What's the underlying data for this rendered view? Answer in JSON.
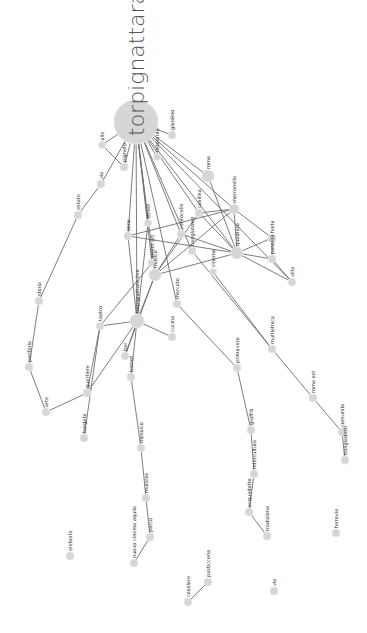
{
  "graph": {
    "title": "torpignattara",
    "node_color": "#d6d6d6",
    "edge_color": "#6e6e6e",
    "nodes": [
      {
        "id": "torpignattara",
        "label": "torpignattara",
        "x": 136,
        "y": 122,
        "r": 22,
        "main": true
      },
      {
        "id": "n1",
        "label": "giardino",
        "x": 172,
        "y": 135,
        "r": 4
      },
      {
        "id": "n2",
        "label": "alle",
        "x": 102,
        "y": 145,
        "r": 3.5
      },
      {
        "id": "n3",
        "label": "pigneto",
        "x": 124,
        "y": 167,
        "r": 4
      },
      {
        "id": "n4",
        "label": "ristorante",
        "x": 157,
        "y": 157,
        "r": 3.5
      },
      {
        "id": "n5",
        "label": "via",
        "x": 101,
        "y": 184,
        "r": 4
      },
      {
        "id": "n6",
        "label": "roma",
        "x": 208,
        "y": 176,
        "r": 6
      },
      {
        "id": "n7",
        "label": "marranella",
        "x": 234,
        "y": 209,
        "r": 5
      },
      {
        "id": "n8",
        "label": "estate",
        "x": 78,
        "y": 215,
        "r": 4
      },
      {
        "id": "n9",
        "label": "street",
        "x": 148,
        "y": 223,
        "r": 3.5
      },
      {
        "id": "n10",
        "label": "casilina",
        "x": 199,
        "y": 213,
        "r": 4
      },
      {
        "id": "n11",
        "label": "zona",
        "x": 128,
        "y": 236,
        "r": 4
      },
      {
        "id": "n12",
        "label": "centocelle",
        "x": 181,
        "y": 234,
        "r": 4
      },
      {
        "id": "n13",
        "label": "festa",
        "x": 272,
        "y": 238,
        "r": 4
      },
      {
        "id": "n14",
        "label": "quadraro",
        "x": 237,
        "y": 253,
        "r": 6
      },
      {
        "id": "n15",
        "label": "street art",
        "x": 152,
        "y": 263,
        "r": 4
      },
      {
        "id": "n16",
        "label": "banglatown",
        "x": 192,
        "y": 251,
        "r": 4
      },
      {
        "id": "n17",
        "label": "mercato",
        "x": 177,
        "y": 304,
        "r": 4
      },
      {
        "id": "n18",
        "label": "pasolini",
        "x": 272,
        "y": 259,
        "r": 4
      },
      {
        "id": "n19",
        "label": "villa",
        "x": 292,
        "y": 282,
        "r": 4
      },
      {
        "id": "n20",
        "label": "musica",
        "x": 155,
        "y": 275,
        "r": 6
      },
      {
        "id": "n21",
        "label": "cinema",
        "x": 213,
        "y": 272,
        "r": 3.5
      },
      {
        "id": "n22",
        "label": "storia",
        "x": 39,
        "y": 301,
        "r": 4
      },
      {
        "id": "n23",
        "label": "teatro",
        "x": 100,
        "y": 326,
        "r": 4
      },
      {
        "id": "n24",
        "label": "torpignattara live",
        "x": 137,
        "y": 321,
        "r": 7
      },
      {
        "id": "n25",
        "label": "cucina",
        "x": 172,
        "y": 337,
        "r": 4
      },
      {
        "id": "n26",
        "label": "bar",
        "x": 125,
        "y": 356,
        "r": 4
      },
      {
        "id": "n27",
        "label": "bistrot",
        "x": 131,
        "y": 377,
        "r": 4
      },
      {
        "id": "n28",
        "label": "periferia",
        "x": 29,
        "y": 367,
        "r": 4
      },
      {
        "id": "n29",
        "label": "multietnica",
        "x": 272,
        "y": 349,
        "r": 4
      },
      {
        "id": "n30",
        "label": "primavera",
        "x": 237,
        "y": 368,
        "r": 4
      },
      {
        "id": "n31",
        "label": "arte",
        "x": 46,
        "y": 412,
        "r": 4
      },
      {
        "id": "n32",
        "label": "quartiere",
        "x": 87,
        "y": 393,
        "r": 4
      },
      {
        "id": "n33",
        "label": "borgata",
        "x": 84,
        "y": 438,
        "r": 4
      },
      {
        "id": "n34",
        "label": "roma est",
        "x": 313,
        "y": 398,
        "r": 4
      },
      {
        "id": "n35",
        "label": "graffiti",
        "x": 251,
        "y": 430,
        "r": 4
      },
      {
        "id": "n36",
        "label": "comunita",
        "x": 342,
        "y": 432,
        "r": 4
      },
      {
        "id": "n37",
        "label": "mosaico",
        "x": 141,
        "y": 448,
        "r": 4
      },
      {
        "id": "n38",
        "label": "bangladesh",
        "x": 345,
        "y": 460,
        "r": 4
      },
      {
        "id": "n39",
        "label": "intercultura",
        "x": 254,
        "y": 474,
        "r": 4
      },
      {
        "id": "n40",
        "label": "murales",
        "x": 146,
        "y": 498,
        "r": 4
      },
      {
        "id": "n41",
        "label": "acquedotto",
        "x": 249,
        "y": 512,
        "r": 4
      },
      {
        "id": "n42",
        "label": "parco",
        "x": 150,
        "y": 537,
        "r": 4
      },
      {
        "id": "n43",
        "label": "tradizione",
        "x": 267,
        "y": 536,
        "r": 4
      },
      {
        "id": "n44",
        "label": "ferrovia",
        "x": 336,
        "y": 533,
        "r": 4
      },
      {
        "id": "n45",
        "label": "elefante",
        "x": 70,
        "y": 556,
        "r": 4
      },
      {
        "id": "n46",
        "label": "nuovo cinema aquila",
        "x": 134,
        "y": 563,
        "r": 4
      },
      {
        "id": "n47",
        "label": "pasticceria",
        "x": 208,
        "y": 582,
        "r": 4
      },
      {
        "id": "n48",
        "label": "casolare",
        "x": 188,
        "y": 602,
        "r": 4
      },
      {
        "id": "n49",
        "label": "via",
        "x": 274,
        "y": 591,
        "r": 4
      }
    ],
    "edges": [
      [
        "torpignattara",
        "n1"
      ],
      [
        "torpignattara",
        "n2"
      ],
      [
        "torpignattara",
        "n3"
      ],
      [
        "torpignattara",
        "n4"
      ],
      [
        "torpignattara",
        "n5"
      ],
      [
        "torpignattara",
        "n6"
      ],
      [
        "torpignattara",
        "n7"
      ],
      [
        "torpignattara",
        "n9"
      ],
      [
        "torpignattara",
        "n10"
      ],
      [
        "torpignattara",
        "n11"
      ],
      [
        "torpignattara",
        "n12"
      ],
      [
        "torpignattara",
        "n14"
      ],
      [
        "torpignattara",
        "n15"
      ],
      [
        "torpignattara",
        "n16"
      ],
      [
        "torpignattara",
        "n17"
      ],
      [
        "torpignattara",
        "n19"
      ],
      [
        "torpignattara",
        "n20"
      ],
      [
        "torpignattara",
        "n24"
      ],
      [
        "n2",
        "n3"
      ],
      [
        "n5",
        "n8"
      ],
      [
        "n8",
        "n22"
      ],
      [
        "n22",
        "n28"
      ],
      [
        "n28",
        "n31"
      ],
      [
        "n31",
        "n32"
      ],
      [
        "n6",
        "n14"
      ],
      [
        "n7",
        "n10"
      ],
      [
        "n7",
        "n14"
      ],
      [
        "n7",
        "n13"
      ],
      [
        "n7",
        "n11"
      ],
      [
        "n7",
        "n20"
      ],
      [
        "n14",
        "n10"
      ],
      [
        "n14",
        "n12"
      ],
      [
        "n14",
        "n18"
      ],
      [
        "n14",
        "n13"
      ],
      [
        "n14",
        "n19"
      ],
      [
        "n14",
        "n11"
      ],
      [
        "n14",
        "n20"
      ],
      [
        "n13",
        "n18"
      ],
      [
        "n18",
        "n19"
      ],
      [
        "n10",
        "n20"
      ],
      [
        "n12",
        "n20"
      ],
      [
        "n11",
        "n24"
      ],
      [
        "n9",
        "n24"
      ],
      [
        "n20",
        "n24"
      ],
      [
        "n20",
        "n26"
      ],
      [
        "n16",
        "n29"
      ],
      [
        "n24",
        "n25"
      ],
      [
        "n24",
        "n26"
      ],
      [
        "n24",
        "n27"
      ],
      [
        "n24",
        "n32"
      ],
      [
        "n24",
        "n23"
      ],
      [
        "n15",
        "n23"
      ],
      [
        "n23",
        "n33"
      ],
      [
        "n23",
        "n32"
      ],
      [
        "n17",
        "n30"
      ],
      [
        "n30",
        "n35"
      ],
      [
        "n35",
        "n39"
      ],
      [
        "n39",
        "n41"
      ],
      [
        "n41",
        "n43"
      ],
      [
        "n21",
        "n29"
      ],
      [
        "n29",
        "n34"
      ],
      [
        "n34",
        "n36"
      ],
      [
        "n36",
        "n38"
      ],
      [
        "n27",
        "n37"
      ],
      [
        "n37",
        "n40"
      ],
      [
        "n40",
        "n42"
      ],
      [
        "n42",
        "n46"
      ],
      [
        "n47",
        "n48"
      ]
    ]
  }
}
